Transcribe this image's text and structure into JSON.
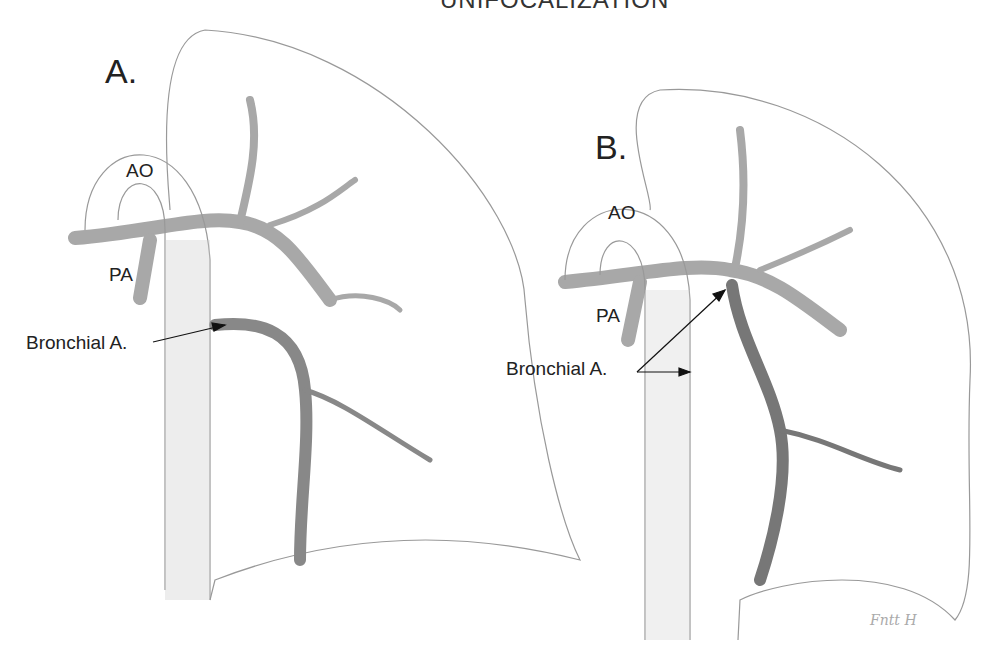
{
  "title": "UNIFOCALIZATION",
  "panel_a": {
    "label": "A.",
    "ao": "AO",
    "pa": "PA",
    "bronchial": "Bronchial A."
  },
  "panel_b": {
    "label": "B.",
    "ao": "AO",
    "pa": "PA",
    "bronchial": "Bronchial A."
  },
  "signature": "88"
}
